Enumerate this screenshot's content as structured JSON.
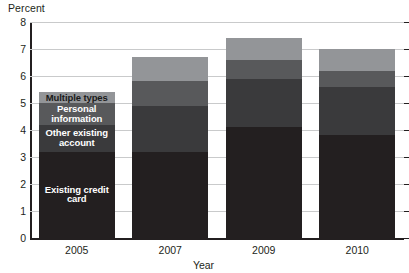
{
  "chart_data": {
    "type": "bar",
    "subtype": "stacked-bar",
    "title": "",
    "xlabel": "Year",
    "ylabel": "Percent",
    "categories": [
      "2005",
      "2007",
      "2009",
      "2010"
    ],
    "ylim": [
      0,
      8
    ],
    "yticks": [
      "0",
      "1",
      "2",
      "3",
      "4",
      "5",
      "6",
      "7",
      "8"
    ],
    "grid": true,
    "legend_position": "inside-first-bar",
    "series": [
      {
        "name": "Existing credit card",
        "color": "#231f20",
        "label_color": "#ffffff",
        "values": [
          3.2,
          3.2,
          4.1,
          3.8
        ]
      },
      {
        "name": "Other existing account",
        "color": "#3a3a3c",
        "label_color": "#ffffff",
        "values": [
          1.0,
          1.7,
          1.8,
          1.8
        ]
      },
      {
        "name": "Personal information",
        "color": "#58595b",
        "label_color": "#ffffff",
        "values": [
          0.8,
          0.9,
          0.7,
          0.6
        ]
      },
      {
        "name": "Multiple types",
        "color": "#939598",
        "label_color": "#1a1a1a",
        "values": [
          0.4,
          0.9,
          0.8,
          0.8
        ]
      }
    ],
    "totals": [
      5.4,
      6.7,
      7.4,
      7.0
    ]
  },
  "axis": {
    "y_title": "Percent",
    "x_title": "Year"
  }
}
